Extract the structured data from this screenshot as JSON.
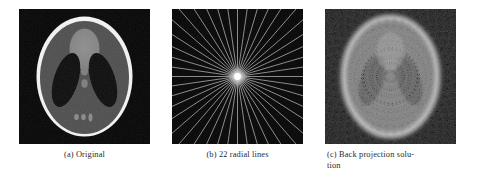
{
  "figure": {
    "background_color": "#ffffff",
    "caption_color": "#2b2b2b",
    "subfigures": [
      {
        "id": "a",
        "name": "original-phantom",
        "caption": "(a) Original",
        "kind": "shepp-logan-phantom",
        "background_color": "#050505"
      },
      {
        "id": "b",
        "name": "radial-lines-sampling",
        "caption": "(b) 22 radial lines",
        "kind": "radial-line-sampling-mask",
        "line_count": 22,
        "background_color": "#070707",
        "line_color": "#b9b9b9",
        "center_color": "#ffffff"
      },
      {
        "id": "c",
        "name": "back-projection-solution",
        "caption_line_1": "(c) Back projection solu-",
        "caption_line_2": "tion",
        "kind": "back-projection-reconstruction",
        "background_color": "#141414"
      }
    ]
  },
  "chart_data": {
    "type": "heatmap",
    "title": "",
    "xlabel": "",
    "ylabel": "",
    "panels": [
      {
        "label": "(a) Original",
        "description": "Shepp-Logan head phantom, grayscale 0-1",
        "features": [
          {
            "name": "outer-skull-ellipse",
            "cx": 0.5,
            "cy": 0.5,
            "rx": 0.4,
            "ry": 0.5,
            "intensity": 1.0
          },
          {
            "name": "inner-brain-ellipse",
            "cx": 0.5,
            "cy": 0.505,
            "rx": 0.372,
            "ry": 0.472,
            "intensity": 0.33
          },
          {
            "name": "left-dark-ellipse",
            "cx": 0.355,
            "cy": 0.52,
            "rx": 0.098,
            "ry": 0.215,
            "rotation_deg": 18,
            "intensity": 0.05
          },
          {
            "name": "right-dark-ellipse",
            "cx": 0.645,
            "cy": 0.52,
            "rx": 0.098,
            "ry": 0.215,
            "rotation_deg": -18,
            "intensity": 0.05
          },
          {
            "name": "top-gray-ellipse",
            "cx": 0.5,
            "cy": 0.3,
            "rx": 0.12,
            "ry": 0.155,
            "intensity": 0.45
          },
          {
            "name": "mid-small-ellipse-1",
            "cx": 0.5,
            "cy": 0.455,
            "rx": 0.028,
            "ry": 0.035,
            "intensity": 0.4
          },
          {
            "name": "mid-small-ellipse-2",
            "cx": 0.5,
            "cy": 0.545,
            "rx": 0.026,
            "ry": 0.032,
            "intensity": 0.4
          },
          {
            "name": "bottom-dot-left",
            "cx": 0.435,
            "cy": 0.8,
            "rx": 0.018,
            "ry": 0.024,
            "intensity": 0.45
          },
          {
            "name": "bottom-dot-center",
            "cx": 0.49,
            "cy": 0.8,
            "rx": 0.018,
            "ry": 0.024,
            "intensity": 0.45
          },
          {
            "name": "bottom-dot-right",
            "cx": 0.545,
            "cy": 0.805,
            "rx": 0.016,
            "ry": 0.03,
            "intensity": 0.45
          }
        ]
      },
      {
        "label": "(b) 22 radial lines",
        "description": "Fourier-domain radial sampling mask with 22 equally spaced lines through the origin",
        "line_count": 22,
        "angle_step_deg": 8.1818,
        "center_intensity": 1.0,
        "line_intensity": 0.72
      },
      {
        "label": "(c) Back projection solution",
        "description": "Reconstruction from 22 radial lines showing diamond-lattice streak artifacts and blurred edges"
      }
    ]
  }
}
